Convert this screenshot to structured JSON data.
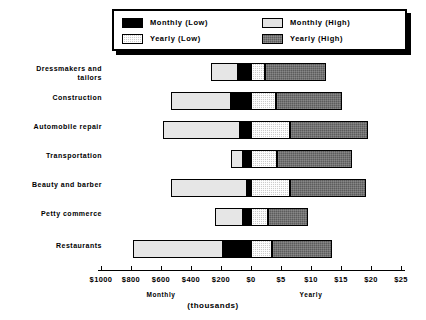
{
  "chart_data": {
    "type": "bar",
    "orientation": "horizontal",
    "style": "diverging-stacked",
    "title": "",
    "subtitle": "",
    "xlabel": "(thousands)",
    "ylabel": "",
    "grid": false,
    "legend_position": "top",
    "axis": {
      "left_side_label": "Monthly",
      "right_side_label": "Yearly",
      "tick_labels": [
        "$1000",
        "$800",
        "$600",
        "$400",
        "$200",
        "$0",
        "$5",
        "$10",
        "$15",
        "$20",
        "$25"
      ],
      "tick_px": [
        101,
        131,
        161,
        191,
        221,
        251,
        281,
        311,
        341,
        371,
        401
      ],
      "zero_px": 251,
      "monthly_axis_range": [
        1000,
        0
      ],
      "yearly_axis_range": [
        0,
        25
      ],
      "monthly_units": "thousands per month",
      "yearly_units": "thousands per year"
    },
    "legend": {
      "entries": [
        {
          "label": "Monthly (Low)",
          "swatch": "black",
          "color": "#000000"
        },
        {
          "label": "Monthly (High)",
          "swatch": "light-gray",
          "color": "#e3e3e3"
        },
        {
          "label": "Yearly (Low)",
          "swatch": "dotted-gray",
          "color": "#cccccc"
        },
        {
          "label": "Yearly (High)",
          "swatch": "dark-gray",
          "color": "#5c5c5c"
        }
      ]
    },
    "categories": [
      "Dressmakers and\ntailors",
      "Construction",
      "Automobile repair",
      "Transportation",
      "Beauty and barber",
      "Petty commerce",
      "Restaurants"
    ],
    "series": [
      {
        "name": "Monthly (Low)",
        "values": [
          100,
          150,
          80,
          60,
          30,
          60,
          200
        ]
      },
      {
        "name": "Monthly (High)",
        "values": [
          270,
          530,
          590,
          130,
          530,
          240,
          790
        ]
      },
      {
        "name": "Yearly (Low)",
        "values": [
          2.3,
          4.1,
          6.5,
          4.3,
          6.5,
          2.9,
          3.5
        ]
      },
      {
        "name": "Yearly (High)",
        "values": [
          12.4,
          15.2,
          19.5,
          16.9,
          19.2,
          9.5,
          13.5
        ]
      }
    ],
    "bars": [
      {
        "category": "Dressmakers and tailors",
        "monthly_high_px": [
          211,
          238
        ],
        "monthly_low_px": [
          238,
          251
        ],
        "yearly_low_px": [
          251,
          265
        ],
        "yearly_high_px": [
          265,
          326
        ],
        "row_top_px": 63
      },
      {
        "category": "Construction",
        "monthly_high_px": [
          171,
          231
        ],
        "monthly_low_px": [
          231,
          251
        ],
        "yearly_low_px": [
          251,
          276
        ],
        "yearly_high_px": [
          276,
          342
        ],
        "row_top_px": 92
      },
      {
        "category": "Automobile repair",
        "monthly_high_px": [
          163,
          240
        ],
        "monthly_low_px": [
          240,
          251
        ],
        "yearly_low_px": [
          251,
          290
        ],
        "yearly_high_px": [
          290,
          368
        ],
        "row_top_px": 121
      },
      {
        "category": "Transportation",
        "monthly_high_px": [
          231,
          243
        ],
        "monthly_low_px": [
          243,
          251
        ],
        "yearly_low_px": [
          251,
          277
        ],
        "yearly_high_px": [
          277,
          352
        ],
        "row_top_px": 150
      },
      {
        "category": "Beauty and barber",
        "monthly_high_px": [
          171,
          247
        ],
        "monthly_low_px": [
          247,
          251
        ],
        "yearly_low_px": [
          251,
          290
        ],
        "yearly_high_px": [
          290,
          366
        ],
        "row_top_px": 179
      },
      {
        "category": "Petty commerce",
        "monthly_high_px": [
          215,
          243
        ],
        "monthly_low_px": [
          243,
          251
        ],
        "yearly_low_px": [
          251,
          268
        ],
        "yearly_high_px": [
          268,
          308
        ],
        "row_top_px": 208
      },
      {
        "category": "Restaurants",
        "monthly_high_px": [
          133,
          223
        ],
        "monthly_low_px": [
          223,
          251
        ],
        "yearly_low_px": [
          251,
          272
        ],
        "yearly_high_px": [
          272,
          332
        ],
        "row_top_px": 240
      }
    ]
  },
  "labels": {
    "cat_0": "Dressmakers and\ntailors",
    "cat_1": "Construction",
    "cat_2": "Automobile repair",
    "cat_3": "Transportation",
    "cat_4": "Beauty and barber",
    "cat_5": "Petty commerce",
    "cat_6": "Restaurants"
  },
  "legend_text": {
    "monthly_low": "Monthly (Low)",
    "monthly_high": "Monthly (High)",
    "yearly_low": "Yearly (Low)",
    "yearly_high": "Yearly (High)"
  },
  "axis_text": {
    "t0": "$1000",
    "t1": "$800",
    "t2": "$600",
    "t3": "$400",
    "t4": "$200",
    "t5": "$0",
    "t6": "$5",
    "t7": "$10",
    "t8": "$15",
    "t9": "$20",
    "t10": "$25",
    "monthly": "Monthly",
    "yearly": "Yearly",
    "units": "(thousands)"
  }
}
